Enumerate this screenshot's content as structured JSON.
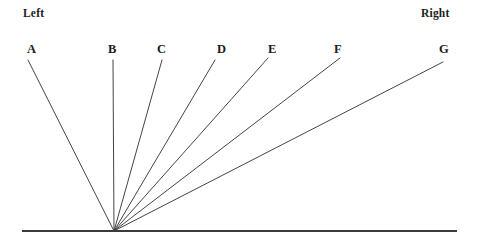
{
  "figure": {
    "title": "",
    "background_color": "#ffffff",
    "line_color": "#3a3a3a",
    "text_color": "#1c1c1c",
    "width": 477,
    "height": 247
  },
  "orientation_labels": {
    "left": {
      "text": "Left",
      "x": 23,
      "y": 8
    },
    "right": {
      "text": "Right",
      "x": 421,
      "y": 8
    }
  },
  "baseline": {
    "name": "horizontal-baseline",
    "x1": 22,
    "y1": 231,
    "x2": 457,
    "y2": 231
  },
  "vertex": {
    "x": 114,
    "y": 231
  },
  "chart_data": {
    "type": "line",
    "title": "",
    "xlabel": "",
    "ylabel": "",
    "grid": false,
    "legend_position": "none",
    "vertex": {
      "x": 114,
      "y": 231
    },
    "baseline_y": 231,
    "axis_range_x": [
      22,
      457
    ],
    "categories": [
      "A",
      "B",
      "C",
      "D",
      "E",
      "F",
      "G"
    ],
    "series": [
      {
        "name": "ray-endpoints-x",
        "values": [
          28,
          113,
          162,
          215,
          268,
          340,
          443
        ]
      },
      {
        "name": "ray-endpoints-y",
        "values": [
          60,
          60,
          60,
          60,
          58,
          58,
          62
        ]
      },
      {
        "name": "angle-from-baseline-degrees",
        "values": [
          117,
          90,
          74,
          60,
          51,
          40,
          27
        ]
      }
    ],
    "rays": [
      {
        "label": "A",
        "x": 28,
        "y": 60,
        "angle_deg": 117,
        "label_x": 27,
        "label_y": 43
      },
      {
        "label": "B",
        "x": 113,
        "y": 60,
        "angle_deg": 90,
        "label_x": 108,
        "label_y": 43
      },
      {
        "label": "C",
        "x": 162,
        "y": 60,
        "angle_deg": 74,
        "label_x": 157,
        "label_y": 43
      },
      {
        "label": "D",
        "x": 215,
        "y": 60,
        "angle_deg": 60,
        "label_x": 217,
        "label_y": 43
      },
      {
        "label": "E",
        "x": 268,
        "y": 58,
        "angle_deg": 51,
        "label_x": 268,
        "label_y": 43
      },
      {
        "label": "F",
        "x": 340,
        "y": 58,
        "angle_deg": 40,
        "label_x": 334,
        "label_y": 43
      },
      {
        "label": "G",
        "x": 443,
        "y": 62,
        "angle_deg": 27,
        "label_x": 439,
        "label_y": 43
      }
    ]
  }
}
